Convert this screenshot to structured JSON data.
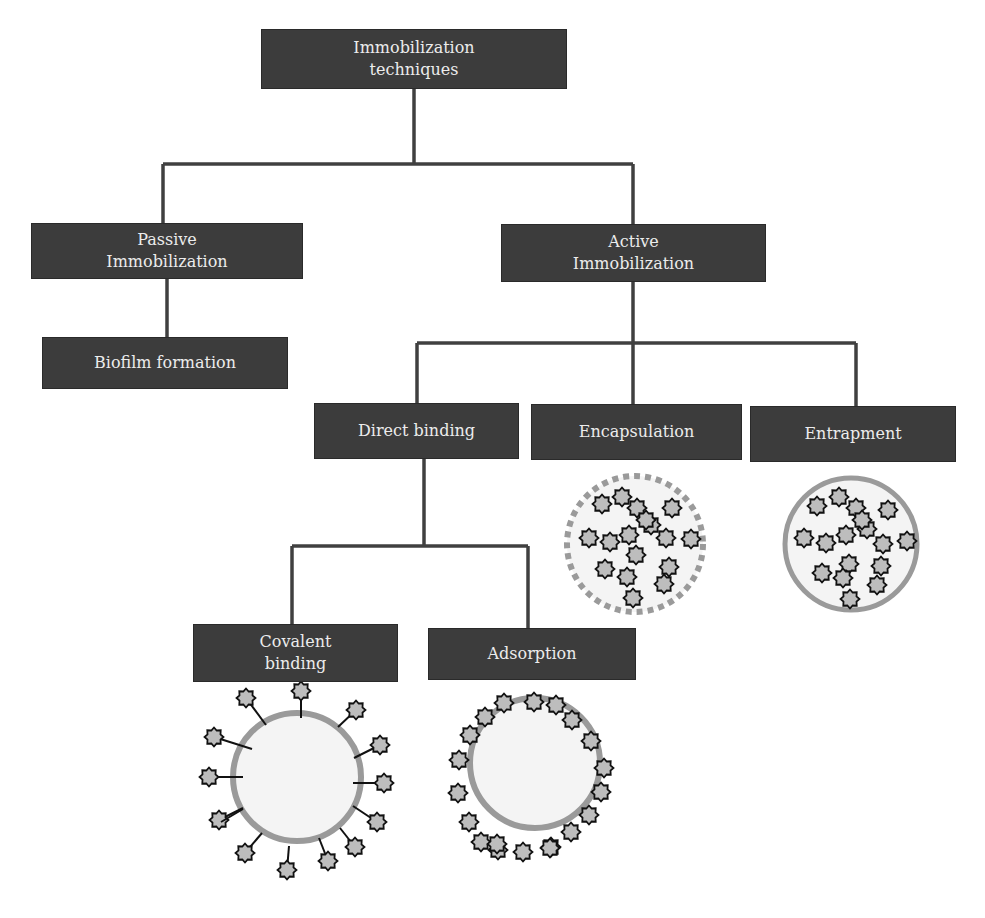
{
  "diagram": {
    "title": "Immobilization techniques",
    "colors": {
      "box_fill": "#3c3c3c",
      "box_text": "#ececec",
      "connector": "#404040",
      "bead_fill": "#f4f4f4",
      "bead_border": "#9a9a9a",
      "cell_fill": "#bdbdbd",
      "cell_stroke": "#111111"
    },
    "nodes": {
      "root": {
        "lines": [
          "Immobilization",
          "techniques"
        ]
      },
      "passive": {
        "lines": [
          "Passive",
          "Immobilization"
        ]
      },
      "biofilm": {
        "lines": [
          "Biofilm formation"
        ]
      },
      "active": {
        "lines": [
          "Active",
          "Immobilization"
        ]
      },
      "direct": {
        "lines": [
          "Direct binding"
        ]
      },
      "encapsulation": {
        "lines": [
          "Encapsulation"
        ]
      },
      "entrapment": {
        "lines": [
          "Entrapment"
        ]
      },
      "covalent": {
        "lines": [
          "Covalent",
          "binding"
        ]
      },
      "adsorption": {
        "lines": [
          "Adsorption"
        ]
      }
    },
    "edges": [
      [
        "root",
        "passive"
      ],
      [
        "root",
        "active"
      ],
      [
        "passive",
        "biofilm"
      ],
      [
        "active",
        "direct"
      ],
      [
        "active",
        "encapsulation"
      ],
      [
        "active",
        "entrapment"
      ],
      [
        "direct",
        "covalent"
      ],
      [
        "direct",
        "adsorption"
      ]
    ],
    "illustrations": [
      {
        "name": "encapsulation-bead",
        "style": "dashed-membrane",
        "cell_count": 17,
        "cells_inside": true
      },
      {
        "name": "entrapment-bead",
        "style": "solid-matrix",
        "cell_count": 17,
        "cells_inside": true
      },
      {
        "name": "covalent-bead",
        "style": "tethered-surface",
        "cell_count": 14,
        "cells_inside": false
      },
      {
        "name": "adsorption-bead",
        "style": "surface-adsorbed",
        "cell_count": 20,
        "cells_inside": false
      }
    ]
  }
}
